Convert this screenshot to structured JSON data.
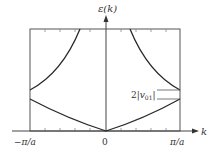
{
  "diagram": {
    "y_axis_label": "ε(k)",
    "x_axis_label": "k",
    "x_ticks": [
      "−π/a",
      "0",
      "π/a"
    ],
    "gap_label": "2|v01|",
    "gap_label_main": "2|",
    "gap_label_v": "v",
    "gap_label_sub": "01",
    "gap_label_end": "|",
    "bands": [
      {
        "name": "lower band",
        "shape": "parabola minimum at k=0, rising to band edge at ±π/a"
      },
      {
        "name": "upper band",
        "shape": "starts at gap top at ±π/a, rising steeply toward k=0"
      }
    ],
    "colors": {
      "line": "#2a2a2a",
      "frame": "#555555",
      "text": "#333333"
    }
  }
}
